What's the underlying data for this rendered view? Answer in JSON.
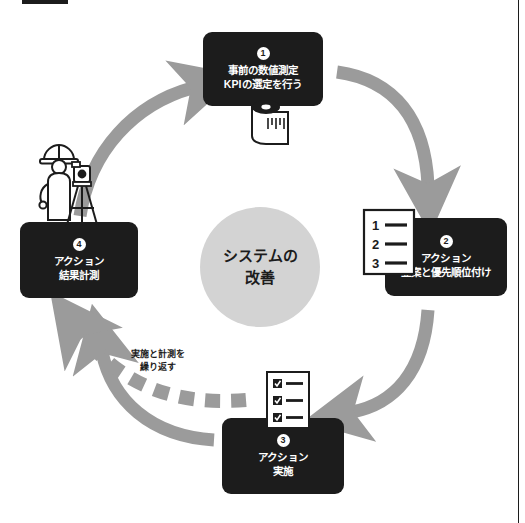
{
  "figure": {
    "title_visible": false,
    "hub": {
      "name": "center-hub",
      "lines": [
        "システムの",
        "改善"
      ],
      "color": "#d3d3d3"
    },
    "loop_caption": {
      "lines": [
        "実施と計測を",
        "繰り返す"
      ]
    },
    "colors": {
      "node_fill": "#1c1c1c",
      "node_text": "#ffffff",
      "arrow": "#9b9b9b",
      "dashed_arrow": "#9b9b9b",
      "hub_fill": "#d3d3d3",
      "page": "#ffffff",
      "rule": "#1c1c1c"
    },
    "nodes": [
      {
        "id": "node-1",
        "number": "1",
        "lines": [
          "事前の数値測定",
          "KPIの選定を行う"
        ],
        "icon": "tape-measure-icon"
      },
      {
        "id": "node-2",
        "number": "2",
        "lines": [
          "アクション",
          "立案と優先順位付け"
        ],
        "icon": "numbered-list-icon"
      },
      {
        "id": "node-3",
        "number": "3",
        "lines": [
          "アクション",
          "実施"
        ],
        "icon": "checklist-icon"
      },
      {
        "id": "node-4",
        "number": "4",
        "lines": [
          "アクション",
          "結果計測"
        ],
        "icon": "surveyor-icon"
      }
    ],
    "list_icon_numbers": [
      "1",
      "2",
      "3"
    ],
    "arrows": [
      {
        "from": "node-1",
        "to": "node-2",
        "style": "solid-curved"
      },
      {
        "from": "node-2",
        "to": "node-3",
        "style": "solid-curved"
      },
      {
        "from": "node-3",
        "to": "node-4",
        "style": "solid-curved"
      },
      {
        "from": "node-4",
        "to": "node-1",
        "style": "solid-curved"
      },
      {
        "from": "node-3",
        "to": "node-4",
        "style": "dashed-thick"
      }
    ]
  }
}
